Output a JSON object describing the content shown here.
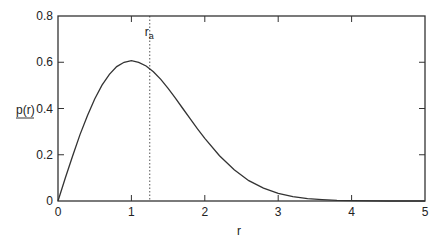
{
  "chart_data": {
    "type": "line",
    "title": "",
    "xlabel": "r",
    "ylabel": "p(r)",
    "xlim": [
      0,
      5
    ],
    "ylim": [
      0,
      0.8
    ],
    "xticks": [
      0,
      1,
      2,
      3,
      4,
      5
    ],
    "xtick_labels": [
      "0",
      "1",
      "2",
      "3",
      "4",
      "5"
    ],
    "yticks": [
      0,
      0.2,
      0.4,
      0.6,
      0.8
    ],
    "ytick_labels": [
      "0",
      "0.2",
      "0.4",
      "0.6",
      "0.8"
    ],
    "grid": false,
    "legend": null,
    "series": [
      {
        "name": "p(r)",
        "style": "solid",
        "x": [
          0,
          0.1,
          0.2,
          0.3,
          0.4,
          0.5,
          0.6,
          0.7,
          0.8,
          0.9,
          1.0,
          1.1,
          1.2,
          1.3,
          1.4,
          1.5,
          1.6,
          1.7,
          1.8,
          1.9,
          2.0,
          2.2,
          2.4,
          2.6,
          2.8,
          3.0,
          3.2,
          3.4,
          3.6,
          3.8,
          4.0,
          4.5,
          5.0
        ],
        "y": [
          0,
          0.0995,
          0.196,
          0.287,
          0.369,
          0.441,
          0.501,
          0.548,
          0.581,
          0.6,
          0.607,
          0.6,
          0.584,
          0.559,
          0.526,
          0.487,
          0.445,
          0.4,
          0.356,
          0.312,
          0.271,
          0.196,
          0.135,
          0.088,
          0.056,
          0.033,
          0.019,
          0.01,
          0.0055,
          0.0028,
          0.0013,
          0.00018,
          2e-05
        ]
      }
    ],
    "annotations": [
      {
        "type": "vline",
        "x": 1.25,
        "style": "dotted",
        "label": "r",
        "label_subscript": "a"
      }
    ]
  },
  "labels": {
    "xlabel": "r",
    "ylabel": "p(r)",
    "ra_main": "r",
    "ra_sub": "a"
  }
}
